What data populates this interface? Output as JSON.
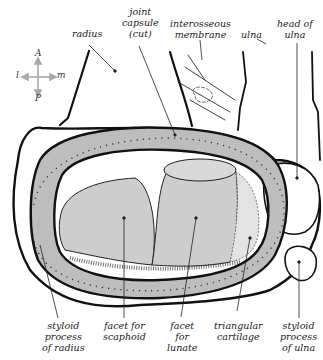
{
  "diagram": {
    "type": "anatomical-illustration",
    "colors": {
      "capsule_fill": "#b9b9b9",
      "facet_fill": "#cfcfcf",
      "outline": "#111111",
      "compass": "#a8a8a8"
    }
  },
  "compass": {
    "anterior": "A",
    "posterior": "P",
    "lateral": "l",
    "medial": "m"
  },
  "labels": {
    "radius": "radius",
    "joint_capsule": [
      "joint",
      "capsule",
      "(cut)"
    ],
    "interosseous_membrane": [
      "interosseous",
      "membrane"
    ],
    "ulna": "ulna",
    "head_of_ulna": [
      "head of",
      "ulna"
    ],
    "styloid_process_of_radius": [
      "styloid",
      "process",
      "of radius"
    ],
    "facet_for_scaphoid": [
      "facet for",
      "scaphoid"
    ],
    "facet_for_lunate": [
      "facet",
      "for",
      "lunate"
    ],
    "triangular_cartilage": [
      "triangular",
      "cartilage"
    ],
    "styloid_process_of_ulna": [
      "styloid",
      "process",
      "of ulna"
    ]
  }
}
